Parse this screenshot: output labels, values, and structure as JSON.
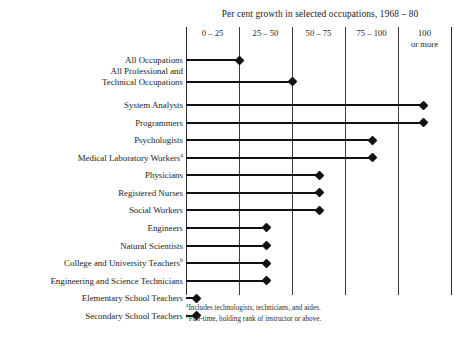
{
  "chart_data": {
    "type": "bar",
    "title": "Per cent growth in selected occupations, 1968 – 80",
    "xlabel": "",
    "ylabel": "",
    "xlim": [
      0,
      125
    ],
    "grid": true,
    "legend_position": "none",
    "orientation": "horizontal",
    "axis_ticks": [
      0,
      25,
      50,
      75,
      100,
      125
    ],
    "band_labels": [
      "0 – 25",
      "25 – 50",
      "50 – 75",
      "75 – 100",
      "100\nor more"
    ],
    "categories": [
      "All Occupations",
      "All Professional and\nTechnical Occupations",
      "System Analysts",
      "Programmers",
      "Psychologists",
      "Medical Laboratory Workers",
      "Physicians",
      "Registered Nurses",
      "Social Workers",
      "Engineers",
      "Natural Scientists",
      "College and University Teachers",
      "Engineering and Science Technicians",
      "Elementary School Teachers",
      "Secondary School Teachers"
    ],
    "values": [
      25,
      50,
      112,
      112,
      88,
      88,
      63,
      63,
      63,
      38,
      38,
      38,
      38,
      5,
      5
    ],
    "footnote_markers": [
      "",
      "",
      "",
      "",
      "",
      "a",
      "",
      "",
      "",
      "",
      "",
      "b",
      "",
      "",
      ""
    ],
    "annotations": [
      "Includes technologists, technicians, and aides.",
      "Full-time, holding rank of instructor or above."
    ]
  },
  "header": {
    "title": "Per cent growth in selected occupations, 1968 – 80"
  },
  "columns": [
    {
      "label": "0 – 25"
    },
    {
      "label": "25 – 50"
    },
    {
      "label": "50 – 75"
    },
    {
      "label": "75 – 100"
    },
    {
      "label": "100\nor more"
    }
  ],
  "rows": [
    {
      "label": "All Occupations",
      "marker": "",
      "value": 25
    },
    {
      "label": "All Professional and\nTechnical Occupations",
      "marker": "",
      "value": 50
    },
    {
      "label": "System Analysts",
      "marker": "",
      "value": 112
    },
    {
      "label": "Programmers",
      "marker": "",
      "value": 112
    },
    {
      "label": "Psychologists",
      "marker": "",
      "value": 88
    },
    {
      "label": "Medical Laboratory Workers",
      "marker": "a",
      "value": 88
    },
    {
      "label": "Physicians",
      "marker": "",
      "value": 63
    },
    {
      "label": "Registered Nurses",
      "marker": "",
      "value": 63
    },
    {
      "label": "Social Workers",
      "marker": "",
      "value": 63
    },
    {
      "label": "Engineers",
      "marker": "",
      "value": 38
    },
    {
      "label": "Natural Scientists",
      "marker": "",
      "value": 38
    },
    {
      "label": "College and University Teachers",
      "marker": "b",
      "value": 38
    },
    {
      "label": "Engineering and Science Technicians",
      "marker": "",
      "value": 38
    },
    {
      "label": "Elementary School Teachers",
      "marker": "",
      "value": 5
    },
    {
      "label": "Secondary School Teachers",
      "marker": "",
      "value": 5
    }
  ],
  "footnotes": [
    {
      "marker": "a",
      "text": "Includes technologists, technicians, and aides."
    },
    {
      "marker": "b",
      "text": "Full-time, holding rank of instructor or above."
    }
  ],
  "colors": {
    "bar": "#111111",
    "gridline": "#3a3a3a",
    "text": "#1d1d1d",
    "background": "#ffffff"
  }
}
